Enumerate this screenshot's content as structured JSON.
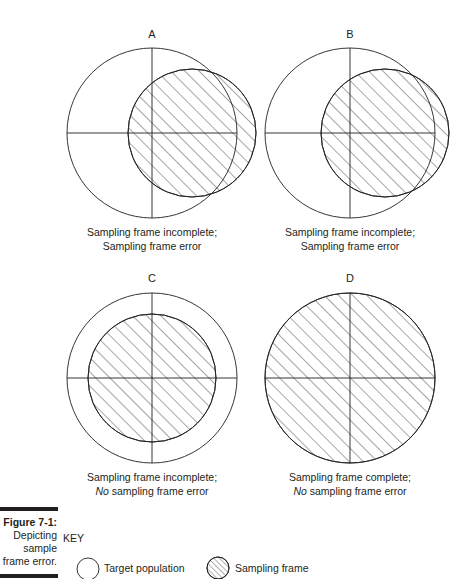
{
  "panels": [
    {
      "id": "A",
      "caption_line1": "Sampling frame incomplete;",
      "caption_line2_prefix": "",
      "caption_line2": "Sampling frame error"
    },
    {
      "id": "B",
      "caption_line1": "Sampling frame incomplete;",
      "caption_line2_prefix": "",
      "caption_line2": "Sampling frame error"
    },
    {
      "id": "C",
      "caption_line1": "Sampling frame incomplete;",
      "caption_line2_prefix": "No",
      "caption_line2": " sampling frame error"
    },
    {
      "id": "D",
      "caption_line1": "Sampling frame complete;",
      "caption_line2_prefix": "No",
      "caption_line2": " sampling frame error"
    }
  ],
  "figure": {
    "number": "Figure 7-1:",
    "desc1": "Depicting",
    "desc2": "sample",
    "desc3": "frame error."
  },
  "key": {
    "title": "KEY",
    "items": [
      {
        "symbol": "open-circle",
        "label": "Target population"
      },
      {
        "symbol": "hatched-circle",
        "label": "Sampling frame"
      }
    ]
  },
  "colors": {
    "ink": "#231f20",
    "background": "#ffffff"
  }
}
